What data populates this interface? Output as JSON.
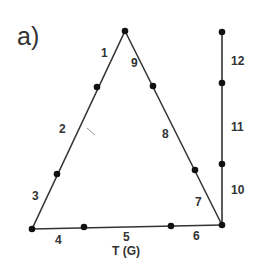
{
  "panel_label": "a)",
  "axis_label": "T (G)",
  "style": {
    "line_color": "#333333",
    "background": "#ffffff"
  },
  "nodes": {
    "apex": [
      125,
      31
    ],
    "left_upper": [
      97,
      87
    ],
    "left_lower": [
      57,
      174
    ],
    "bottom_left": [
      32,
      229
    ],
    "bottom_a": [
      84,
      227
    ],
    "bottom_b": [
      171,
      226
    ],
    "bottom_right": [
      222,
      225
    ],
    "right_upper": [
      153,
      86
    ],
    "right_lower": [
      195,
      170
    ],
    "vert_top": [
      222,
      32
    ],
    "vert_upper": [
      222,
      83
    ],
    "vert_lower": [
      222,
      164
    ]
  },
  "segments": [
    {
      "id": "1",
      "label": "1",
      "label_pos": [
        101,
        57
      ]
    },
    {
      "id": "2",
      "label": "2",
      "label_pos": [
        63,
        133
      ]
    },
    {
      "id": "3",
      "label": "3",
      "label_pos": [
        32,
        200
      ]
    },
    {
      "id": "4",
      "label": "4",
      "label_pos": [
        56,
        243
      ]
    },
    {
      "id": "5",
      "label": "5",
      "label_pos": [
        124,
        242
      ]
    },
    {
      "id": "6",
      "label": "6",
      "label_pos": [
        195,
        240
      ]
    },
    {
      "id": "7",
      "label": "7",
      "label_pos": [
        197,
        205
      ]
    },
    {
      "id": "8",
      "label": "8",
      "label_pos": [
        163,
        137
      ]
    },
    {
      "id": "9",
      "label": "9",
      "label_pos": [
        131,
        66
      ]
    },
    {
      "id": "10",
      "label": "10",
      "label_pos": [
        231,
        192
      ]
    },
    {
      "id": "11",
      "label": "11",
      "label_pos": [
        231,
        130
      ]
    },
    {
      "id": "12",
      "label": "12",
      "label_pos": [
        231,
        64
      ]
    }
  ]
}
